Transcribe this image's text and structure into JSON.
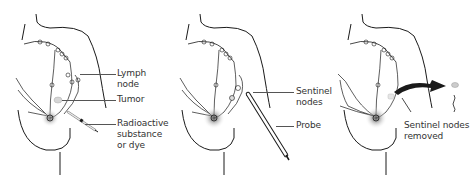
{
  "diagram": {
    "panels": [
      {
        "step": 1,
        "labels": [
          {
            "text": "Lymph node"
          },
          {
            "text": "Tumor"
          },
          {
            "text": "Radioactive\nsubstance\nor dye"
          }
        ]
      },
      {
        "step": 2,
        "labels": [
          {
            "text": "Sentinel\nnodes"
          },
          {
            "text": "Probe"
          }
        ]
      },
      {
        "step": 3,
        "labels": [
          {
            "text": "Sentinel nodes\nremoved"
          }
        ]
      }
    ],
    "colors": {
      "line": "#1a1a1a",
      "label_text": "#333333",
      "leader_line": "#555555",
      "tumor_fill": "#d6d6d6",
      "dye_shadow": "#8a8a8a",
      "arrow": "#1a1a1a"
    }
  }
}
